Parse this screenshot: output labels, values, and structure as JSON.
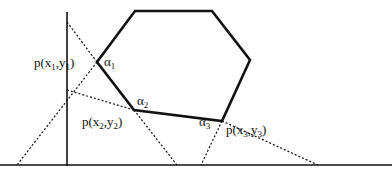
{
  "diagram": {
    "type": "geometry",
    "colors": {
      "stroke": "#111111",
      "background": "#ffffff"
    },
    "axes": {
      "vertical": {
        "x": 67,
        "y1": 12,
        "y2": 166
      },
      "horizontal": {
        "y": 165,
        "x1": 0,
        "x2": 392
      }
    },
    "polygon": {
      "vertices": [
        [
          135,
          11
        ],
        [
          212,
          11
        ],
        [
          250,
          60
        ],
        [
          222,
          121
        ],
        [
          134,
          110
        ],
        [
          97,
          62
        ]
      ]
    },
    "dotted_lines": [
      {
        "from": [
          67,
          22
        ],
        "to": [
          97,
          62
        ]
      },
      {
        "from": [
          97,
          62
        ],
        "to": [
          17,
          165
        ]
      },
      {
        "from": [
          67,
          90
        ],
        "to": [
          134,
          110
        ]
      },
      {
        "from": [
          134,
          110
        ],
        "to": [
          177,
          165
        ]
      },
      {
        "from": [
          222,
          121
        ],
        "to": [
          201,
          165
        ]
      },
      {
        "from": [
          222,
          121
        ],
        "to": [
          318,
          165
        ]
      }
    ],
    "labels": {
      "alpha1": {
        "symbol": "α",
        "sub": "1",
        "x": 104,
        "y": 55
      },
      "alpha2": {
        "symbol": "α",
        "sub": "2",
        "x": 137,
        "y": 94
      },
      "alpha3": {
        "symbol": "α",
        "sub": "3",
        "x": 199,
        "y": 115
      },
      "p1": {
        "prefix": "p(x",
        "sub1": "1",
        "mid": ",y",
        "sub2": "1",
        "suffix": ")",
        "x": 34,
        "y": 56
      },
      "p2": {
        "prefix": "p(x",
        "sub1": "2",
        "mid": ",y",
        "sub2": "2",
        "suffix": ")",
        "x": 82,
        "y": 115
      },
      "p3": {
        "prefix": "p(x",
        "sub1": "3",
        "mid": ",y",
        "sub2": "3",
        "suffix": ")",
        "x": 226,
        "y": 123
      }
    }
  }
}
